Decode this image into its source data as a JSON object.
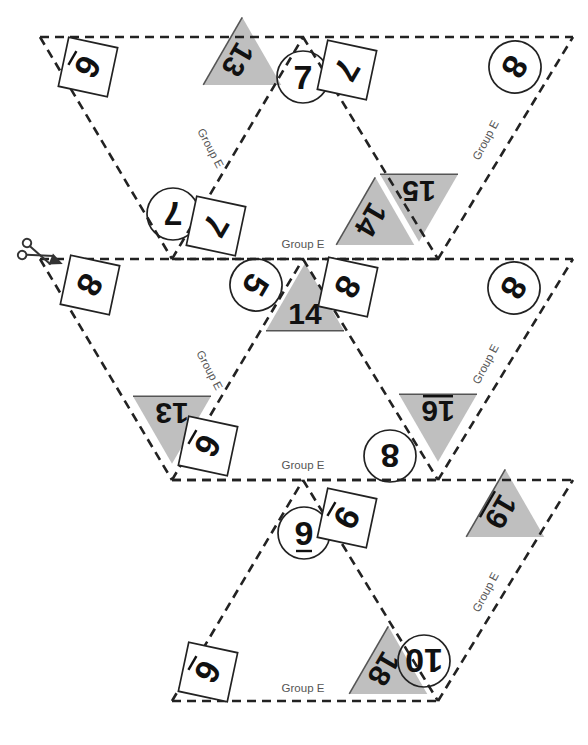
{
  "page": {
    "background_color": "#ffffff",
    "shaded_triangle_color": "#bfbfbf",
    "line_color": "#222222",
    "label_color": "#555555",
    "group_label": "Group E",
    "scissors_icon": "scissors-icon",
    "cut_line_label": "cut-line"
  },
  "group_labels": [
    {
      "id": "g1",
      "text": "Group E",
      "x": 207,
      "y": 150,
      "rot": 62
    },
    {
      "id": "g2",
      "text": "Group E",
      "x": 489,
      "y": 142,
      "rot": -62
    },
    {
      "id": "g3",
      "text": "Group E",
      "x": 303,
      "y": 248,
      "rot": 0
    },
    {
      "id": "g4",
      "text": "Group E",
      "x": 206,
      "y": 372,
      "rot": 62
    },
    {
      "id": "g5",
      "text": "Group E",
      "x": 489,
      "y": 366,
      "rot": -62
    },
    {
      "id": "g6",
      "text": "Group E",
      "x": 303,
      "y": 469,
      "rot": 0
    },
    {
      "id": "g7",
      "text": "Group E",
      "x": 489,
      "y": 594,
      "rot": -62
    },
    {
      "id": "g8",
      "text": "Group E",
      "x": 303,
      "y": 692,
      "rot": 0
    }
  ],
  "shaded_triangles": [
    {
      "id": "t13-top",
      "value": "13",
      "rot": 120,
      "cx": 252,
      "cy": 68,
      "underline": false
    },
    {
      "id": "t15",
      "value": "15",
      "rot": 180,
      "cx": 419,
      "cy": 208,
      "underline": false
    },
    {
      "id": "t14-top",
      "value": "14",
      "rot": 120,
      "cx": 385,
      "cy": 228,
      "underline": false
    },
    {
      "id": "t14-mid",
      "value": "14",
      "rot": 0,
      "cx": 305,
      "cy": 297,
      "underline": false
    },
    {
      "id": "t13-mid",
      "value": "13",
      "rot": 180,
      "cx": 172,
      "cy": 430,
      "underline": false
    },
    {
      "id": "t16",
      "value": "16",
      "rot": 180,
      "cx": 438,
      "cy": 428,
      "underline": true
    },
    {
      "id": "t19",
      "value": "19",
      "rot": 120,
      "cx": 515,
      "cy": 520,
      "underline": true
    },
    {
      "id": "t18",
      "value": "18",
      "rot": 120,
      "cx": 398,
      "cy": 677,
      "underline": false
    }
  ],
  "circle_markers": [
    {
      "id": "c7-top",
      "value": "7",
      "rot": 0,
      "cx": 303,
      "cy": 77,
      "underline": false
    },
    {
      "id": "c8-topr",
      "value": "8",
      "rot": 120,
      "cx": 515,
      "cy": 67,
      "underline": false
    },
    {
      "id": "c7-left",
      "value": "7",
      "rot": 180,
      "cx": 173,
      "cy": 214,
      "underline": false
    },
    {
      "id": "c5",
      "value": "5",
      "rot": 120,
      "cx": 256,
      "cy": 285,
      "underline": false
    },
    {
      "id": "c8-midr",
      "value": "8",
      "rot": 120,
      "cx": 514,
      "cy": 288,
      "underline": false
    },
    {
      "id": "c8-16",
      "value": "8",
      "rot": 180,
      "cx": 390,
      "cy": 456,
      "underline": false
    },
    {
      "id": "c9",
      "value": "9",
      "rot": 0,
      "cx": 304,
      "cy": 533,
      "underline": true
    },
    {
      "id": "c10",
      "value": "10",
      "rot": 180,
      "cx": 424,
      "cy": 661,
      "underline": false
    }
  ],
  "square_markers": [
    {
      "id": "s6-topl",
      "value": "6",
      "rot": 120,
      "cx": 88,
      "cy": 67,
      "underline": true
    },
    {
      "id": "s7-top",
      "value": "7",
      "rot": 120,
      "cx": 347,
      "cy": 70,
      "underline": false
    },
    {
      "id": "s7-left",
      "value": "7",
      "rot": 120,
      "cx": 216,
      "cy": 226,
      "underline": false
    },
    {
      "id": "s8-midl",
      "value": "8",
      "rot": 120,
      "cx": 90,
      "cy": 285,
      "underline": false
    },
    {
      "id": "s8-14",
      "value": "8",
      "rot": 120,
      "cx": 348,
      "cy": 287,
      "underline": false
    },
    {
      "id": "s6-13",
      "value": "6",
      "rot": 120,
      "cx": 208,
      "cy": 446,
      "underline": true
    },
    {
      "id": "s9",
      "value": "9",
      "rot": 120,
      "cx": 347,
      "cy": 518,
      "underline": true
    },
    {
      "id": "s6-bot",
      "value": "6",
      "rot": 120,
      "cx": 208,
      "cy": 672,
      "underline": true
    }
  ]
}
